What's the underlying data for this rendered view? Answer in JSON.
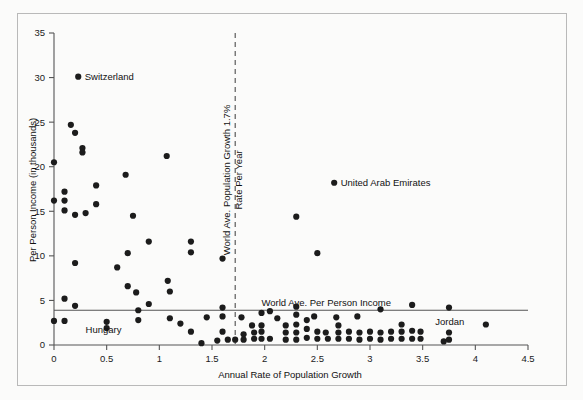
{
  "chart_data": {
    "type": "scatter",
    "title": "",
    "xlabel": "Annual Rate of Population Growth",
    "ylabel": "Per Person Income (in thousands)",
    "xlim": [
      0,
      4.5
    ],
    "ylim": [
      0,
      35
    ],
    "xticks": [
      "0",
      "0.5",
      "1",
      "1.5",
      "2",
      "2.5",
      "3",
      "3.5",
      "4",
      "4.5"
    ],
    "xtick_values": [
      0,
      0.5,
      1,
      1.5,
      2,
      2.5,
      3,
      3.5,
      4,
      4.5
    ],
    "yticks": [
      "0",
      "5",
      "10",
      "15",
      "20",
      "25",
      "30",
      "35"
    ],
    "ytick_values": [
      0,
      5,
      10,
      15,
      20,
      25,
      30,
      35
    ],
    "grid": false,
    "legend": "none",
    "marker": "filled-circle",
    "marker_color": "#1c1c1c",
    "reference_lines": [
      {
        "name": "world-ave-population-growth",
        "orientation": "vertical",
        "value": 1.72,
        "style": "dashed",
        "label": "World Ave. Population Growth 1.7% Rate Per Year"
      },
      {
        "name": "world-ave-per-person-income",
        "orientation": "horizontal",
        "value": 3.9,
        "style": "solid",
        "label": "World Ave. Per Person Income"
      }
    ],
    "annotations": [
      {
        "name": "switzerland",
        "label": "Switzerland",
        "x": 0.23,
        "y": 30.1
      },
      {
        "name": "united-arab-emirates",
        "label": "United Arab Emirates",
        "x": 2.66,
        "y": 18.2
      },
      {
        "name": "hungary",
        "label": "Hungary",
        "x": 0.3,
        "y": 1.35
      },
      {
        "name": "jordan",
        "label": "Jordan",
        "x": 3.62,
        "y": 2.3
      }
    ],
    "points": [
      {
        "x": 0.0,
        "y": 20.5
      },
      {
        "x": 0.0,
        "y": 16.2
      },
      {
        "x": 0.0,
        "y": 2.7
      },
      {
        "x": 0.1,
        "y": 17.2
      },
      {
        "x": 0.1,
        "y": 16.2
      },
      {
        "x": 0.1,
        "y": 15.1
      },
      {
        "x": 0.1,
        "y": 5.2
      },
      {
        "x": 0.1,
        "y": 2.7
      },
      {
        "x": 0.16,
        "y": 24.7
      },
      {
        "x": 0.2,
        "y": 23.8
      },
      {
        "x": 0.2,
        "y": 14.6
      },
      {
        "x": 0.2,
        "y": 9.2
      },
      {
        "x": 0.2,
        "y": 4.4
      },
      {
        "x": 0.27,
        "y": 22.1
      },
      {
        "x": 0.27,
        "y": 21.6
      },
      {
        "x": 0.3,
        "y": 14.8
      },
      {
        "x": 0.4,
        "y": 17.9
      },
      {
        "x": 0.4,
        "y": 15.8
      },
      {
        "x": 0.5,
        "y": 2.6
      },
      {
        "x": 0.5,
        "y": 1.9
      },
      {
        "x": 0.6,
        "y": 8.7
      },
      {
        "x": 0.68,
        "y": 19.1
      },
      {
        "x": 0.7,
        "y": 10.3
      },
      {
        "x": 0.7,
        "y": 6.6
      },
      {
        "x": 0.75,
        "y": 14.5
      },
      {
        "x": 0.78,
        "y": 5.9
      },
      {
        "x": 0.8,
        "y": 3.9
      },
      {
        "x": 0.8,
        "y": 2.8
      },
      {
        "x": 0.9,
        "y": 11.6
      },
      {
        "x": 0.9,
        "y": 4.6
      },
      {
        "x": 1.07,
        "y": 21.2
      },
      {
        "x": 1.08,
        "y": 7.2
      },
      {
        "x": 1.1,
        "y": 6.0
      },
      {
        "x": 1.1,
        "y": 3.0
      },
      {
        "x": 1.2,
        "y": 2.4
      },
      {
        "x": 1.3,
        "y": 11.6
      },
      {
        "x": 1.3,
        "y": 10.4
      },
      {
        "x": 1.3,
        "y": 1.5
      },
      {
        "x": 1.4,
        "y": 0.2
      },
      {
        "x": 1.45,
        "y": 3.1
      },
      {
        "x": 1.55,
        "y": 0.5
      },
      {
        "x": 1.6,
        "y": 9.7
      },
      {
        "x": 1.6,
        "y": 4.2
      },
      {
        "x": 1.6,
        "y": 3.2
      },
      {
        "x": 1.6,
        "y": 1.5
      },
      {
        "x": 1.65,
        "y": 0.6
      },
      {
        "x": 1.72,
        "y": 0.6
      },
      {
        "x": 1.78,
        "y": 3.1
      },
      {
        "x": 1.8,
        "y": 1.2
      },
      {
        "x": 1.8,
        "y": 0.6
      },
      {
        "x": 1.88,
        "y": 2.2
      },
      {
        "x": 1.9,
        "y": 1.4
      },
      {
        "x": 1.9,
        "y": 0.7
      },
      {
        "x": 1.97,
        "y": 3.6
      },
      {
        "x": 1.97,
        "y": 2.2
      },
      {
        "x": 1.97,
        "y": 1.5
      },
      {
        "x": 1.97,
        "y": 0.7
      },
      {
        "x": 2.05,
        "y": 3.8
      },
      {
        "x": 2.05,
        "y": 0.7
      },
      {
        "x": 2.12,
        "y": 3.0
      },
      {
        "x": 2.2,
        "y": 2.2
      },
      {
        "x": 2.2,
        "y": 1.4
      },
      {
        "x": 2.2,
        "y": 0.6
      },
      {
        "x": 2.3,
        "y": 14.4
      },
      {
        "x": 2.3,
        "y": 4.3
      },
      {
        "x": 2.3,
        "y": 3.4
      },
      {
        "x": 2.3,
        "y": 2.3
      },
      {
        "x": 2.3,
        "y": 1.4
      },
      {
        "x": 2.3,
        "y": 0.6
      },
      {
        "x": 2.4,
        "y": 2.8
      },
      {
        "x": 2.4,
        "y": 1.8
      },
      {
        "x": 2.4,
        "y": 0.8
      },
      {
        "x": 2.47,
        "y": 3.2
      },
      {
        "x": 2.5,
        "y": 10.3
      },
      {
        "x": 2.5,
        "y": 1.5
      },
      {
        "x": 2.5,
        "y": 0.7
      },
      {
        "x": 2.58,
        "y": 1.4
      },
      {
        "x": 2.6,
        "y": 0.7
      },
      {
        "x": 2.68,
        "y": 3.1
      },
      {
        "x": 2.7,
        "y": 2.2
      },
      {
        "x": 2.7,
        "y": 1.4
      },
      {
        "x": 2.7,
        "y": 0.7
      },
      {
        "x": 2.8,
        "y": 1.5
      },
      {
        "x": 2.8,
        "y": 0.7
      },
      {
        "x": 2.88,
        "y": 3.2
      },
      {
        "x": 2.9,
        "y": 1.4
      },
      {
        "x": 2.9,
        "y": 0.6
      },
      {
        "x": 3.0,
        "y": 1.5
      },
      {
        "x": 3.0,
        "y": 0.7
      },
      {
        "x": 3.1,
        "y": 4.0
      },
      {
        "x": 3.1,
        "y": 1.4
      },
      {
        "x": 3.1,
        "y": 0.6
      },
      {
        "x": 3.2,
        "y": 1.5
      },
      {
        "x": 3.2,
        "y": 0.7
      },
      {
        "x": 3.3,
        "y": 2.3
      },
      {
        "x": 3.3,
        "y": 1.5
      },
      {
        "x": 3.3,
        "y": 0.7
      },
      {
        "x": 3.4,
        "y": 4.5
      },
      {
        "x": 3.4,
        "y": 1.6
      },
      {
        "x": 3.4,
        "y": 0.7
      },
      {
        "x": 3.48,
        "y": 1.5
      },
      {
        "x": 3.48,
        "y": 0.7
      },
      {
        "x": 3.7,
        "y": 0.4
      },
      {
        "x": 3.75,
        "y": 4.2
      },
      {
        "x": 3.75,
        "y": 1.4
      },
      {
        "x": 3.75,
        "y": 0.6
      },
      {
        "x": 4.1,
        "y": 2.3
      }
    ]
  },
  "figure": {
    "background_color": "#fbfbfa",
    "frame_color": "#b9b9b9",
    "axis_color": "#555555",
    "marker_color": "#1c1c1c"
  }
}
